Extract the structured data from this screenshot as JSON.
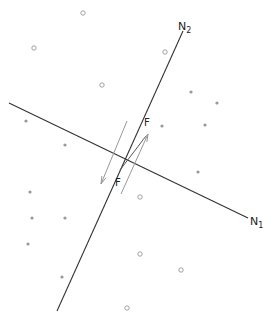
{
  "diagram": {
    "type": "fault-plane-force-diagram",
    "axes": [
      {
        "id": "N1",
        "label": "N",
        "subscript": "1",
        "x1": 9,
        "y1": 103,
        "x2": 248,
        "y2": 218,
        "label_x": 250,
        "label_y": 225
      },
      {
        "id": "N2",
        "label": "N",
        "subscript": "2",
        "x1": 57,
        "y1": 311,
        "x2": 183,
        "y2": 31,
        "label_x": 178,
        "label_y": 30
      }
    ],
    "forces": [
      {
        "id": "force-up",
        "label": "F",
        "x1": 121,
        "y1": 194,
        "x2": 148,
        "y2": 134,
        "label_x": 144,
        "label_y": 126
      },
      {
        "id": "force-down",
        "label": "F",
        "x1": 127,
        "y1": 121,
        "x2": 101,
        "y2": 184,
        "label_x": 115,
        "label_y": 186
      }
    ],
    "slip_segment": {
      "x1": 120,
      "y1": 170,
      "x2": 146,
      "y2": 136
    },
    "filled_points": [
      {
        "x": 26,
        "y": 121
      },
      {
        "x": 65,
        "y": 145
      },
      {
        "x": 191,
        "y": 92
      },
      {
        "x": 217,
        "y": 103
      },
      {
        "x": 162,
        "y": 126
      },
      {
        "x": 205,
        "y": 125
      },
      {
        "x": 198,
        "y": 172
      },
      {
        "x": 30,
        "y": 192
      },
      {
        "x": 32,
        "y": 218
      },
      {
        "x": 65,
        "y": 218
      },
      {
        "x": 28,
        "y": 244
      },
      {
        "x": 62,
        "y": 277
      }
    ],
    "open_points": [
      {
        "x": 83,
        "y": 13
      },
      {
        "x": 34,
        "y": 48
      },
      {
        "x": 102,
        "y": 85
      },
      {
        "x": 165,
        "y": 52
      },
      {
        "x": 140,
        "y": 197
      },
      {
        "x": 140,
        "y": 254
      },
      {
        "x": 181,
        "y": 270
      },
      {
        "x": 127,
        "y": 308
      }
    ],
    "colors": {
      "axis": "#333333",
      "force": "#999999",
      "point": "#999999",
      "label": "#222222"
    }
  }
}
